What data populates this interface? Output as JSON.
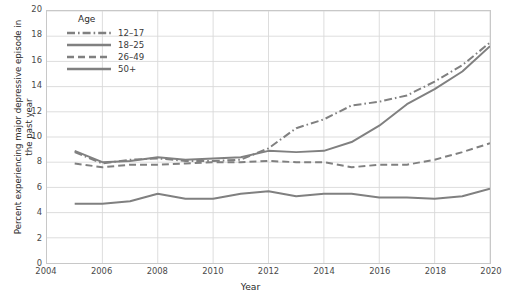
{
  "chart_data": {
    "type": "line",
    "title": "",
    "xlabel": "Year",
    "ylabel": "Percent experiencing major depressive episode in the past year",
    "xlim": [
      2004,
      2020
    ],
    "ylim": [
      0,
      20
    ],
    "xticks": [
      "2004",
      "2006",
      "2008",
      "2010",
      "2012",
      "2014",
      "2016",
      "2018",
      "2020"
    ],
    "yticks": [
      "0",
      "2",
      "4",
      "6",
      "8",
      "10",
      "12",
      "14",
      "16",
      "18",
      "20"
    ],
    "grid": true,
    "legend_title": "Age",
    "legend_position": "top-left inside",
    "line_color": "#808080",
    "grid_color": "#d9d9d9",
    "x": [
      2005,
      2006,
      2007,
      2008,
      2009,
      2010,
      2011,
      2012,
      2013,
      2014,
      2015,
      2016,
      2017,
      2018,
      2019,
      2020
    ],
    "series": [
      {
        "name": "12–17",
        "style": "dashdot",
        "values": [
          8.8,
          7.9,
          8.2,
          8.3,
          8.1,
          8.1,
          8.2,
          9.1,
          10.7,
          11.4,
          12.5,
          12.8,
          13.3,
          14.4,
          15.7,
          17.5
        ]
      },
      {
        "name": "18–25",
        "style": "solid",
        "values": [
          8.9,
          8.0,
          8.1,
          8.4,
          8.2,
          8.3,
          8.4,
          8.9,
          8.8,
          8.9,
          9.6,
          10.9,
          12.6,
          13.8,
          15.2,
          17.2
        ]
      },
      {
        "name": "26–49",
        "style": "dashed",
        "values": [
          7.9,
          7.6,
          7.8,
          7.8,
          7.9,
          8.0,
          8.0,
          8.1,
          8.0,
          8.0,
          7.6,
          7.8,
          7.8,
          8.2,
          8.8,
          9.5
        ]
      },
      {
        "name": "50+",
        "style": "solid",
        "values": [
          4.7,
          4.7,
          4.9,
          5.5,
          5.1,
          5.1,
          5.5,
          5.7,
          5.3,
          5.5,
          5.5,
          5.2,
          5.2,
          5.1,
          5.3,
          5.9
        ]
      }
    ]
  }
}
